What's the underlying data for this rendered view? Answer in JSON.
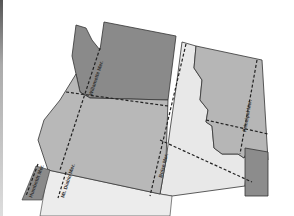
{
  "map": {
    "type": "reference map",
    "region": "Pacific Northwest",
    "colors": {
      "background": "#ffffff",
      "dark_state": "#8a8a8a",
      "medium_state": "#b4b4b4",
      "light_state": "#e6e6e6",
      "border": "#333333",
      "meridian_line": "#222222"
    },
    "regions": [
      {
        "name": "washington",
        "shade": "dark"
      },
      {
        "name": "oregon",
        "shade": "medium"
      },
      {
        "name": "idaho",
        "shade": "light"
      },
      {
        "name": "montana",
        "shade": "medium"
      },
      {
        "name": "california",
        "shade": "dark"
      },
      {
        "name": "nevada",
        "shade": "light"
      },
      {
        "name": "wyoming",
        "shade": "dark"
      }
    ],
    "labels": [
      {
        "id": "willamette",
        "text": "Willamette Mer."
      },
      {
        "id": "boise",
        "text": "Boise Mer."
      },
      {
        "id": "principal",
        "text": "Principal Mer."
      },
      {
        "id": "humboldt",
        "text": "Humboldt Mer."
      },
      {
        "id": "mount_diablo",
        "text": "Mt. Diablo Mer."
      }
    ]
  }
}
